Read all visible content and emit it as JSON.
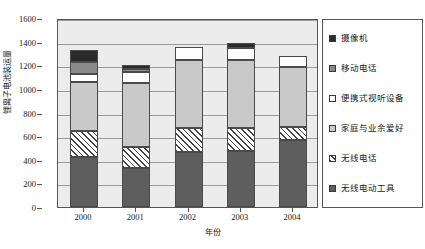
{
  "chart_data": {
    "type": "bar",
    "stacked": true,
    "title": "",
    "xlabel": "年份",
    "ylabel": "锂离子电池装运量",
    "categories": [
      "2000",
      "2001",
      "2002",
      "2003",
      "2004"
    ],
    "ylim": [
      0,
      1600
    ],
    "yticks": [
      0,
      200,
      400,
      600,
      800,
      1000,
      1200,
      1400,
      1600
    ],
    "ytick_labels": [
      "0",
      "200",
      "400",
      "600",
      "800",
      "1000",
      "1200",
      "1400",
      "1600"
    ],
    "grid": true,
    "legend_position": "right",
    "series": [
      {
        "name": "无线电动工具",
        "color": "#5e5e5e",
        "pattern": "solid-dark-gray",
        "values": [
          420,
          330,
          465,
          470,
          565
        ]
      },
      {
        "name": "无线电话",
        "color": "#ffffff",
        "pattern": "diagonal-hatch",
        "values": [
          225,
          175,
          200,
          195,
          110
        ]
      },
      {
        "name": "家庭与业余爱好",
        "color": "#c9c9c9",
        "pattern": "solid-light-gray",
        "values": [
          410,
          545,
          580,
          580,
          510
        ]
      },
      {
        "name": "便携式视听设备",
        "color": "#ffffff",
        "pattern": "solid-white",
        "values": [
          70,
          90,
          110,
          105,
          95
        ]
      },
      {
        "name": "移动电话",
        "color": "#8a8a8a",
        "pattern": "solid-medium-gray",
        "values": [
          105,
          30,
          0,
          0,
          0
        ]
      },
      {
        "name": "摄像机",
        "color": "#2b2b2b",
        "pattern": "solid-black",
        "values": [
          100,
          30,
          0,
          35,
          0
        ]
      }
    ],
    "totals": [
      1330,
      1200,
      1355,
      1385,
      1280
    ]
  },
  "legend": {
    "items": [
      {
        "label": "摄像机",
        "swatch": "solid-black"
      },
      {
        "label": "移动电话",
        "swatch": "solid-medium-gray"
      },
      {
        "label": "便携式视听设备",
        "swatch": "solid-white"
      },
      {
        "label": "家庭与业余爱好",
        "swatch": "solid-light-gray"
      },
      {
        "label": "无线电话",
        "swatch": "diagonal-hatch"
      },
      {
        "label": "无线电动工具",
        "swatch": "solid-dark-gray"
      }
    ]
  },
  "colors": {
    "camcorder": "#2b2b2b",
    "mobile_phone": "#8a8a8a",
    "portable_av": "#ffffff",
    "home_hobby": "#c9c9c9",
    "cordless_phone": "#ffffff",
    "power_tools": "#5e5e5e",
    "plot_background": "#ececec",
    "gridline": "#9a9a9a",
    "axis": "#555555"
  }
}
